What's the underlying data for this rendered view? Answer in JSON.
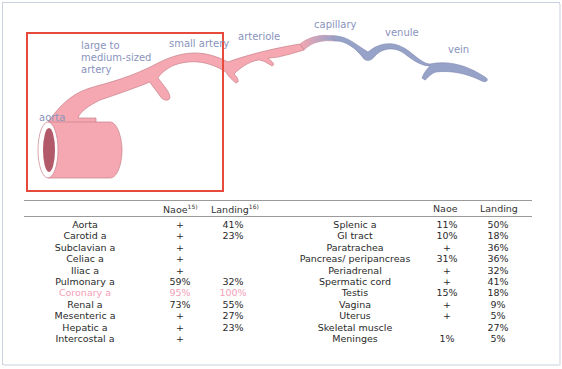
{
  "diagram": {
    "labels": {
      "aorta": "aorta",
      "large_artery": [
        "large to",
        "medium-sized",
        "artery"
      ],
      "small_artery": "small artery",
      "arteriole": "arteriole",
      "capillary": "capillary",
      "venule": "venule",
      "vein": "vein"
    },
    "colors": {
      "artery_fill": "#f5a8b1",
      "artery_lumen": "#b35a6a",
      "vein_fill": "#97a2c8",
      "highlight_box": "#e64a3a",
      "label_text": "#8a93bd",
      "highlight_text": "#f2a0b6"
    }
  },
  "table": {
    "left": {
      "headers": {
        "site": "",
        "naoe": "Naoe",
        "naoe_ref": "15)",
        "landing": "Landing",
        "landing_ref": "16)"
      },
      "rows": [
        {
          "site": "Aorta",
          "naoe": "+",
          "landing": "41%"
        },
        {
          "site": "Carotid a",
          "naoe": "+",
          "landing": "23%"
        },
        {
          "site": "Subclavian a",
          "naoe": "+",
          "landing": ""
        },
        {
          "site": "Celiac a",
          "naoe": "+",
          "landing": ""
        },
        {
          "site": "Iliac a",
          "naoe": "+",
          "landing": ""
        },
        {
          "site": "Pulmonary a",
          "naoe": "59%",
          "landing": "32%"
        },
        {
          "site": "Coronary a",
          "naoe": "95%",
          "landing": "100%",
          "highlight": true
        },
        {
          "site": "Renal a",
          "naoe": "73%",
          "landing": "55%"
        },
        {
          "site": "Mesenteric a",
          "naoe": "+",
          "landing": "27%"
        },
        {
          "site": "Hepatic a",
          "naoe": "+",
          "landing": "23%"
        },
        {
          "site": "Intercostal a",
          "naoe": "+",
          "landing": ""
        }
      ]
    },
    "right": {
      "headers": {
        "site": "",
        "naoe": "Naoe",
        "landing": "Landing"
      },
      "rows": [
        {
          "site": "Splenic a",
          "naoe": "11%",
          "landing": "50%"
        },
        {
          "site": "GI tract",
          "naoe": "10%",
          "landing": "18%"
        },
        {
          "site": "Paratrachea",
          "naoe": "+",
          "landing": "36%"
        },
        {
          "site": "Pancreas/ peripancreas",
          "naoe": "31%",
          "landing": "36%"
        },
        {
          "site": "Periadrenal",
          "naoe": "+",
          "landing": "32%"
        },
        {
          "site": "Spermatic cord",
          "naoe": "+",
          "landing": "41%"
        },
        {
          "site": "Testis",
          "naoe": "15%",
          "landing": "18%"
        },
        {
          "site": "Vagina",
          "naoe": "+",
          "landing": "9%"
        },
        {
          "site": "Uterus",
          "naoe": "+",
          "landing": "5%"
        },
        {
          "site": "Skeletal muscle",
          "naoe": "",
          "landing": "27%"
        },
        {
          "site": "Meninges",
          "naoe": "1%",
          "landing": "5%"
        }
      ]
    }
  }
}
